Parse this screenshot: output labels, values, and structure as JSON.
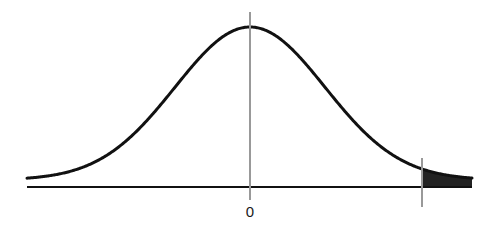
{
  "diagram": {
    "type": "normal-distribution-curve",
    "center_label": "0",
    "shaded_region": "right-tail",
    "colors": {
      "curve": "#111111",
      "axis": "#111111",
      "center_line": "#999999",
      "critical_line": "#999999",
      "tail_fill": "#222222"
    },
    "geometry": {
      "axis_y": 187,
      "axis_x_start": 27,
      "axis_x_end": 472,
      "mean_x": 250,
      "peak_y": 27,
      "sigma_px": 75,
      "tail_asymptote_y": 180,
      "critical_x": 422,
      "center_line_top": 12,
      "center_line_bottom": 200,
      "critical_line_top": 158,
      "critical_line_bottom": 207
    }
  }
}
